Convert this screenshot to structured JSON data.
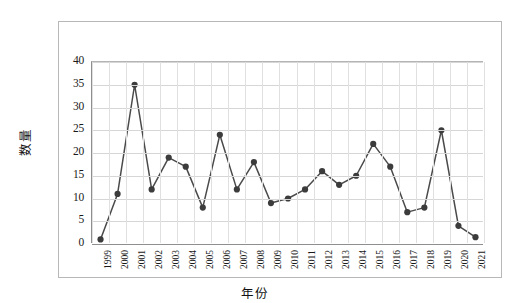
{
  "chart_data": {
    "type": "line",
    "title": "",
    "xlabel": "年份",
    "ylabel": "数量",
    "categories": [
      "1999",
      "2000",
      "2001",
      "2002",
      "2003",
      "2004",
      "2005",
      "2006",
      "2007",
      "2008",
      "2009",
      "2010",
      "2011",
      "2012",
      "2013",
      "2014",
      "2015",
      "2016",
      "2017",
      "2018",
      "2019",
      "2020",
      "2021"
    ],
    "values": [
      1,
      11,
      35,
      12,
      19,
      17,
      8,
      24,
      12,
      18,
      9,
      10,
      12,
      16,
      13,
      15,
      22,
      17,
      7,
      8,
      25,
      4,
      1.5
    ],
    "series": [
      {
        "name": "数量",
        "values": [
          1,
          11,
          35,
          12,
          19,
          17,
          8,
          24,
          12,
          18,
          9,
          10,
          12,
          16,
          13,
          15,
          22,
          17,
          7,
          8,
          25,
          4,
          1.5
        ]
      }
    ],
    "ylim": [
      0,
      40
    ],
    "yticks": [
      0,
      5,
      10,
      15,
      20,
      25,
      30,
      35,
      40
    ],
    "ytick_labels": [
      "0",
      "5",
      "10",
      "15",
      "20",
      "25",
      "30",
      "35",
      "40"
    ],
    "grid": true,
    "legend": null,
    "legend_position": "none",
    "marker": "circle",
    "line_color": "#4a4a4a",
    "marker_color": "#3c3c3c",
    "grid_color": "#d8d8d8",
    "axis_color": "#8f8f8f",
    "background_color": "#ffffff",
    "frame_color": "#b8b8b8"
  }
}
